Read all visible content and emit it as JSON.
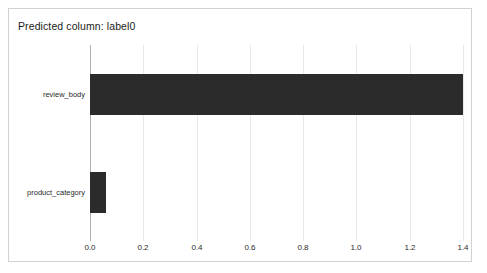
{
  "card": {
    "title": "Predicted column: label0",
    "border_color": "#d2d2d2",
    "background": "#ffffff"
  },
  "chart_data": {
    "type": "bar",
    "orientation": "horizontal",
    "title": "Predicted column: label0",
    "xlabel": "",
    "ylabel": "",
    "categories": [
      "review_body",
      "product_category"
    ],
    "values": [
      1.4,
      0.06
    ],
    "xlim": [
      0.0,
      1.4
    ],
    "xticks": [
      "0.0",
      "0.2",
      "0.4",
      "0.6",
      "0.8",
      "1.0",
      "1.2",
      "1.4"
    ],
    "xtick_values": [
      0.0,
      0.2,
      0.4,
      0.6,
      0.8,
      1.0,
      1.2,
      1.4
    ],
    "grid": true,
    "grid_axis": "x",
    "grid_color": "#e9e9e9",
    "axis_color": "#aeaeae",
    "legend": null,
    "bar_color": "#2b2b2b",
    "series": [
      {
        "name": "feature_importance",
        "values": [
          1.4,
          0.06
        ]
      }
    ]
  }
}
